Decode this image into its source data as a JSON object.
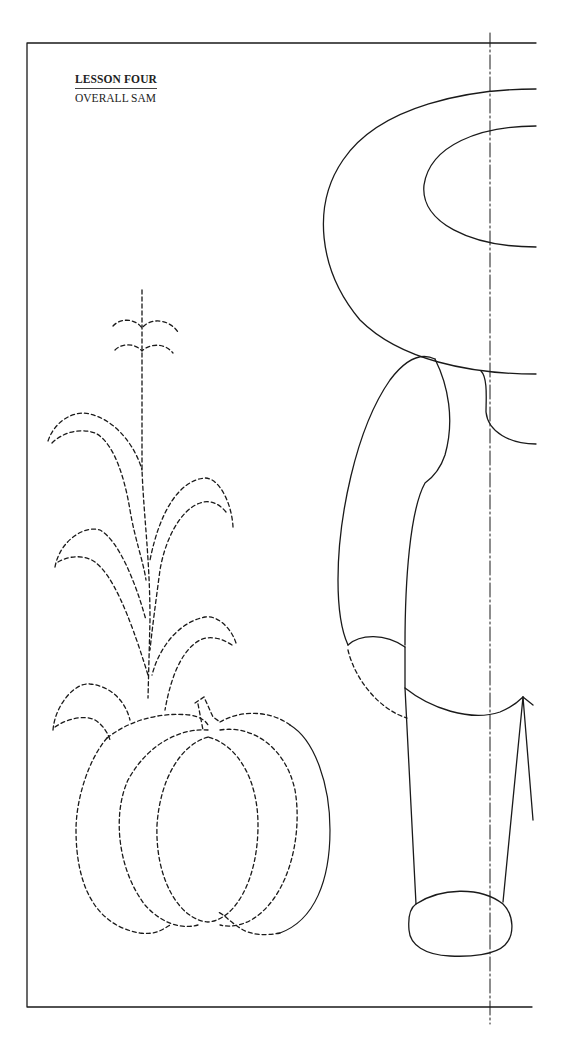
{
  "page": {
    "lesson_label": "LESSON FOUR",
    "pattern_title": "OVERALL SAM"
  },
  "colors": {
    "line": "#1a1a1a",
    "background": "#ffffff"
  },
  "figures": {
    "solid_outline": "overall-sam",
    "dashed_outlines": [
      "corn-stalk",
      "pumpkin",
      "hand"
    ],
    "fold_line": "center-dash-dot"
  }
}
